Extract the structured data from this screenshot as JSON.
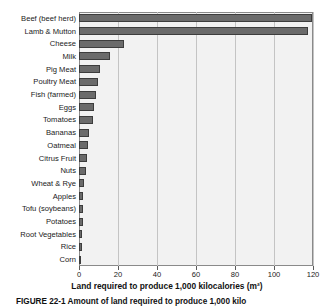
{
  "chart_data": {
    "type": "bar",
    "orientation": "horizontal",
    "title": "",
    "xlabel": "Land required to produce 1,000 kilocalories (m²)",
    "ylabel": "",
    "xlim": [
      0,
      120
    ],
    "xticks": [
      0,
      20,
      40,
      60,
      80,
      100,
      120
    ],
    "xticklabels": [
      "0",
      "20",
      "40",
      "60",
      "80",
      "100",
      "120"
    ],
    "grid": "vertical",
    "legend": "none",
    "categories": [
      "Beef (beef herd)",
      "Lamb & Mutton",
      "Cheese",
      "Milk",
      "Pig Meat",
      "Poultry Meat",
      "Fish (farmed)",
      "Eggs",
      "Tomatoes",
      "Bananas",
      "Oatmeal",
      "Citrus Fruit",
      "Nuts",
      "Wheat & Rye",
      "Apples",
      "Tofu (soybeans)",
      "Potatoes",
      "Root Vegetables",
      "Rice",
      "Corn"
    ],
    "values": [
      119.5,
      117.5,
      23.0,
      16.0,
      11.0,
      9.5,
      8.5,
      7.5,
      7.0,
      5.0,
      4.5,
      4.0,
      3.5,
      2.5,
      2.3,
      2.2,
      1.8,
      1.6,
      1.3,
      1.2
    ],
    "colors": {
      "bar_fill": "#6b6b6b",
      "bar_border": "#3d3d3d",
      "plot_background": "#f2f2f2",
      "gridline": "#c4c4c4",
      "axis": "#8a8a8a",
      "text": "#1a1a1a"
    }
  },
  "caption": {
    "text": "FIGURE 22-1  Amount of land required to produce 1,000 kilo"
  }
}
